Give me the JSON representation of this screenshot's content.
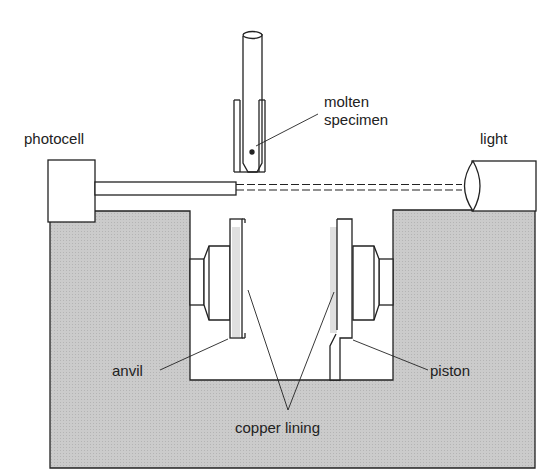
{
  "diagram": {
    "labels": {
      "molten_specimen_line1": "molten",
      "molten_specimen_line2": "specimen",
      "photocell": "photocell",
      "light": "light",
      "anvil": "anvil",
      "piston": "piston",
      "copper_lining": "copper lining"
    },
    "colors": {
      "block_fill": "#c8c8c8",
      "lining_fill": "#e2e2e2",
      "stroke": "#222222"
    }
  }
}
